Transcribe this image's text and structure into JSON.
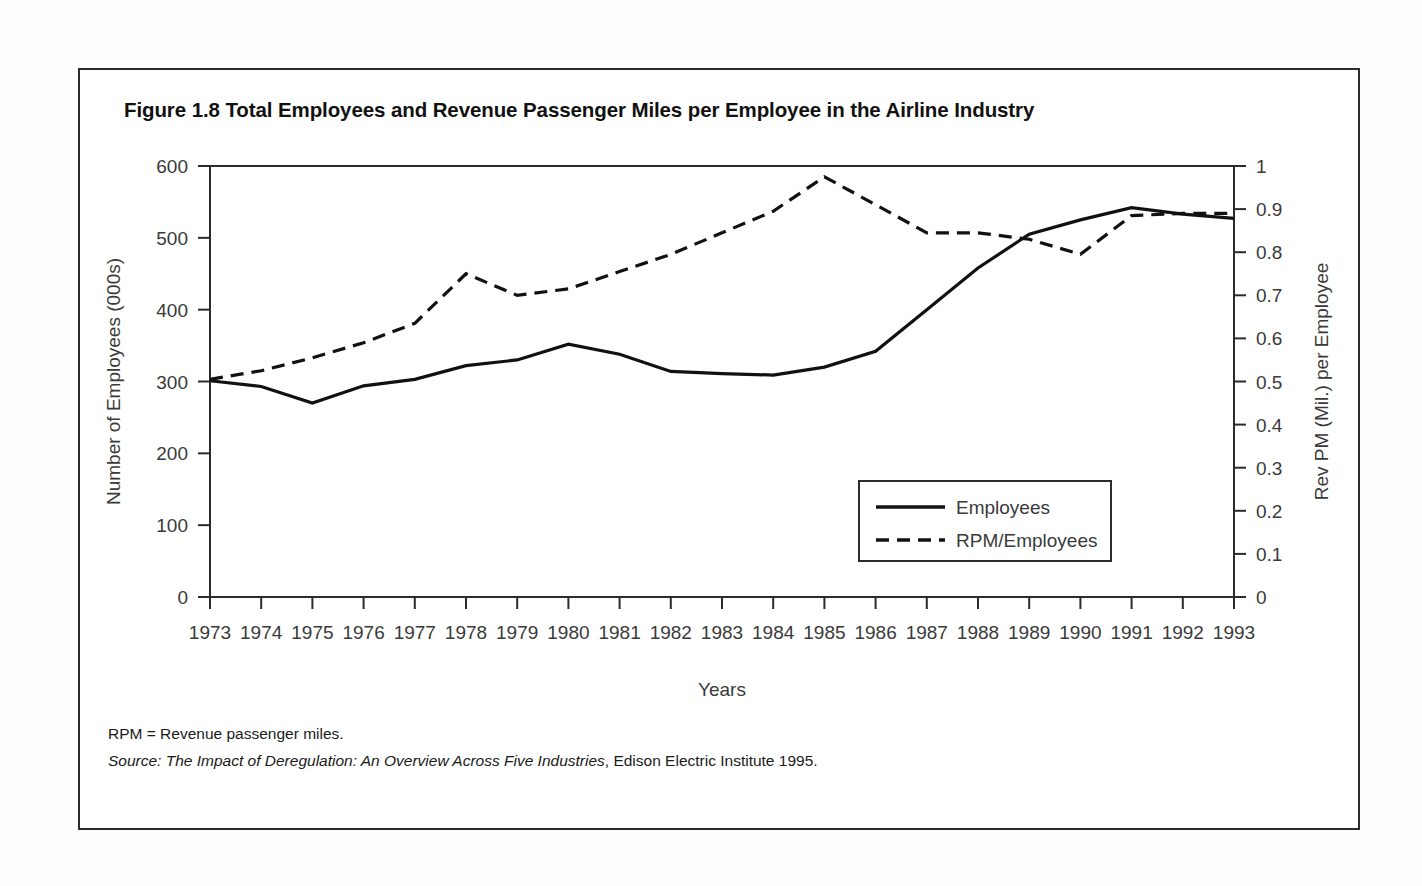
{
  "figure": {
    "title": "Figure 1.8 Total Employees and Revenue Passenger Miles per Employee in the Airline Industry",
    "footnote": "RPM = Revenue passenger miles.",
    "source_prefix": "Source: The Impact of Deregulation: An Overview Across Five Industries",
    "source_suffix": ", Edison Electric Institute 1995."
  },
  "chart_data": {
    "type": "line",
    "title": "Figure 1.8 Total Employees and Revenue Passenger Miles per Employee in the Airline Industry",
    "xlabel": "Years",
    "ylabel": "Number of Employees (000s)",
    "y2label": "Rev PM (Mil.) per Employee",
    "grid": false,
    "legend_position": "inside-bottom-right",
    "x": [
      "1973",
      "1974",
      "1975",
      "1976",
      "1977",
      "1978",
      "1979",
      "1980",
      "1981",
      "1982",
      "1983",
      "1984",
      "1985",
      "1986",
      "1987",
      "1988",
      "1989",
      "1990",
      "1991",
      "1992",
      "1993"
    ],
    "categories": [
      "1973",
      "1974",
      "1975",
      "1976",
      "1977",
      "1978",
      "1979",
      "1980",
      "1981",
      "1982",
      "1983",
      "1984",
      "1985",
      "1986",
      "1987",
      "1988",
      "1989",
      "1990",
      "1991",
      "1992",
      "1993"
    ],
    "xlim": [
      1973,
      1993
    ],
    "ylim": [
      0,
      600
    ],
    "yticks": [
      0,
      100,
      200,
      300,
      400,
      500,
      600
    ],
    "ytick_labels": [
      "0",
      "100",
      "200",
      "300",
      "400",
      "500",
      "600"
    ],
    "y2lim": [
      0,
      1
    ],
    "y2ticks": [
      0,
      0.1,
      0.2,
      0.3,
      0.4,
      0.5,
      0.6,
      0.7,
      0.8,
      0.9,
      1
    ],
    "y2tick_labels": [
      "0",
      "0.1",
      "0.2",
      "0.3",
      "0.4",
      "0.5",
      "0.6",
      "0.7",
      "0.8",
      "0.9",
      "1"
    ],
    "series": [
      {
        "name": "Employees",
        "axis": "left",
        "style": "solid",
        "color": "#111111",
        "values": [
          301,
          293,
          270,
          294,
          303,
          322,
          330,
          352,
          338,
          314,
          311,
          309,
          320,
          342,
          400,
          458,
          505,
          525,
          542,
          533,
          527
        ]
      },
      {
        "name": "RPM/Employees",
        "axis": "right",
        "style": "dashed",
        "color": "#111111",
        "values": [
          0.505,
          0.525,
          0.555,
          0.59,
          0.635,
          0.75,
          0.7,
          0.715,
          0.755,
          0.795,
          0.845,
          0.895,
          0.975,
          0.91,
          0.845,
          0.845,
          0.83,
          0.795,
          0.885,
          0.89,
          0.89
        ]
      }
    ],
    "legend": [
      "Employees",
      "RPM/Employees"
    ]
  },
  "legend": {
    "items": [
      {
        "label": "Employees",
        "style": "solid"
      },
      {
        "label": "RPM/Employees",
        "style": "dashed"
      }
    ]
  }
}
